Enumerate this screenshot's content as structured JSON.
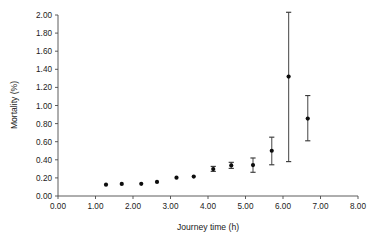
{
  "chart_data": {
    "type": "scatter",
    "title": "",
    "xlabel": "Journey time (h)",
    "ylabel": "Mortality (%)",
    "xlim": [
      0.0,
      8.0
    ],
    "ylim": [
      0.0,
      2.0
    ],
    "xticks": [
      "0.00",
      "1.00",
      "2.00",
      "3.00",
      "4.00",
      "5.00",
      "6.00",
      "7.00",
      "8.00"
    ],
    "xtick_values": [
      0.0,
      1.0,
      2.0,
      3.0,
      4.0,
      5.0,
      6.0,
      7.0,
      8.0
    ],
    "yticks": [
      "0.00",
      "0.20",
      "0.40",
      "0.60",
      "0.80",
      "1.00",
      "1.20",
      "1.40",
      "1.60",
      "1.80",
      "2.00"
    ],
    "ytick_values": [
      0.0,
      0.2,
      0.4,
      0.6,
      0.8,
      1.0,
      1.2,
      1.4,
      1.6,
      1.8,
      2.0
    ],
    "grid": false,
    "legend": false,
    "marker_color": "#0d0d0d",
    "errorbar_color": "#5d5d5d",
    "axis_color": "#4a4a4a",
    "x": [
      1.28,
      1.7,
      2.22,
      2.64,
      3.16,
      3.62,
      4.14,
      4.62,
      5.2,
      5.7,
      6.15,
      6.66
    ],
    "y": [
      0.125,
      0.133,
      0.135,
      0.156,
      0.203,
      0.215,
      0.298,
      0.338,
      0.342,
      0.5,
      1.32,
      0.855
    ],
    "y_lower": [
      0.125,
      0.133,
      0.135,
      0.156,
      0.203,
      0.215,
      0.272,
      0.305,
      0.262,
      0.345,
      0.38,
      0.61
    ],
    "y_upper": [
      0.125,
      0.133,
      0.135,
      0.156,
      0.203,
      0.215,
      0.327,
      0.372,
      0.42,
      0.65,
      2.03,
      1.11
    ],
    "has_errorbars": [
      false,
      false,
      false,
      false,
      false,
      false,
      true,
      true,
      true,
      true,
      true,
      true
    ],
    "series": [
      {
        "name": "Mortality",
        "values": [
          0.125,
          0.133,
          0.135,
          0.156,
          0.203,
          0.215,
          0.298,
          0.338,
          0.342,
          0.5,
          1.32,
          0.855
        ]
      }
    ],
    "annotations": []
  }
}
